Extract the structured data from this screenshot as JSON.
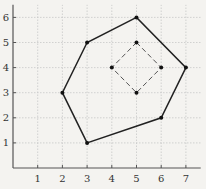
{
  "chart_data": {
    "type": "scatter",
    "title": "",
    "xlabel": "",
    "ylabel": "",
    "xlim": [
      0,
      7.6
    ],
    "ylim": [
      0,
      6.5
    ],
    "grid": true,
    "x_ticks": [
      1,
      2,
      3,
      4,
      5,
      6,
      7
    ],
    "y_ticks": [
      1,
      2,
      3,
      4,
      5,
      6
    ],
    "series": [
      {
        "name": "outer hexagon",
        "style": "solid",
        "closed": true,
        "points": [
          [
            3,
            1
          ],
          [
            2,
            3
          ],
          [
            3,
            5
          ],
          [
            5,
            6
          ],
          [
            7,
            4
          ],
          [
            6,
            2
          ]
        ]
      },
      {
        "name": "inner square",
        "style": "dashed",
        "closed": true,
        "points": [
          [
            5,
            5
          ],
          [
            6,
            4
          ],
          [
            5,
            3
          ],
          [
            4,
            4
          ]
        ]
      }
    ]
  },
  "colors": {
    "background": "#f4f3f0",
    "axis": "#555555",
    "grid": "#c8c8c8",
    "outer_line": "#222222",
    "inner_line": "#555555",
    "point": "#111111"
  }
}
